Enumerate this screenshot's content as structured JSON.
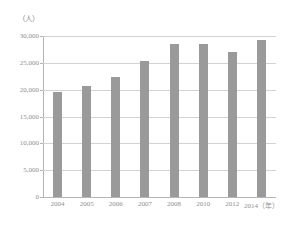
{
  "chart_data": {
    "type": "bar",
    "title": "",
    "subtitle": "",
    "unit_label": "（人）",
    "xlabel": "（年）",
    "ylabel": "",
    "categories": [
      "2004",
      "2005",
      "2006",
      "2007",
      "2008",
      "2010",
      "2012",
      "2014"
    ],
    "category_labels": [
      "2004",
      "2005",
      "2006",
      "2007",
      "2008",
      "2010",
      "2012",
      "2014（年）"
    ],
    "values": [
      19600,
      20600,
      22300,
      25400,
      28600,
      28500,
      27000,
      29200
    ],
    "ylim": [
      0,
      30000
    ],
    "yticks": [
      0,
      5000,
      10000,
      15000,
      20000,
      25000,
      30000
    ],
    "ytick_labels": [
      "0",
      "5,000",
      "10,000",
      "15,000",
      "20,000",
      "25,000",
      "30,000"
    ],
    "grid": true,
    "legend": false,
    "legend_position": "none",
    "bar_color": "#9a9a9a",
    "gridline_color": "#d2d2d2",
    "axis_color": "#b5b5b5",
    "text_color": "#8f8f8f"
  }
}
